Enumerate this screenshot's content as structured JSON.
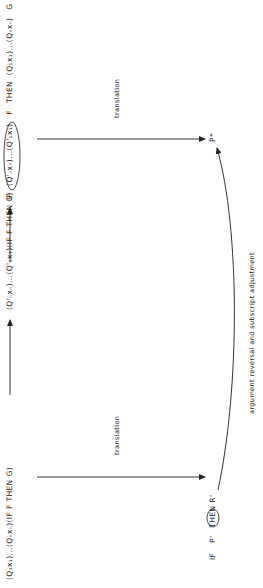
{
  "diagram": {
    "nodes": {
      "original": {
        "text": "(Q₁x₁)...(Qₙxₙ)(IF F THEN G)"
      },
      "reversed": {
        "text": "(Q'ₙxₙ)...(Q'₁x₁)(IF F THEN G)"
      },
      "final": {
        "prefix": "IF",
        "circled": "(Q'ₙxₙ)...(Q'₁x₁)",
        "mid": "F",
        "then": "THEN",
        "suffix": "(Q₁x₁)...(Qₙxₙ)",
        "end": "G"
      },
      "p_star": {
        "text": "P*"
      },
      "translated": {
        "prefix": "IF",
        "circled": "P'",
        "suffix": "THEN R'"
      }
    },
    "edges": {
      "translation_left": "translation",
      "translation_right": "translation",
      "curve_label": "argument reversal and subscript adjustment"
    }
  }
}
